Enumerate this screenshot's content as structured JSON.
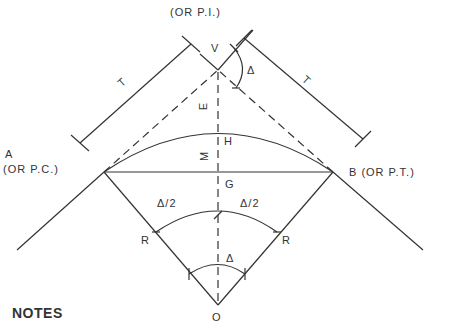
{
  "diagram": {
    "labels": {
      "pi": "(OR P.I.)",
      "v": "V",
      "a": "A",
      "pc": "(OR P.C.)",
      "b": "B (OR P.T.)",
      "t_left": "T",
      "t_right": "T",
      "delta_top": "Δ",
      "e": "E",
      "h": "H",
      "m": "M",
      "g": "G",
      "half_delta_left": "Δ/2",
      "half_delta_right": "Δ/2",
      "r_left": "R",
      "r_right": "R",
      "delta_center": "Δ",
      "o": "O"
    },
    "notes_heading": "NOTES"
  }
}
